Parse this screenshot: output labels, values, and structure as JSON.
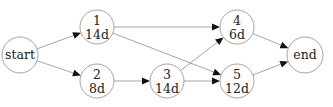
{
  "diagram": {
    "type": "activity-on-node network",
    "nodes": [
      {
        "id": "start",
        "label": "start",
        "duration": null,
        "cx": 20,
        "cy": 55,
        "r": 18
      },
      {
        "id": "1",
        "label": "1",
        "duration": "14d",
        "cx": 97,
        "cy": 27,
        "r": 17
      },
      {
        "id": "2",
        "label": "2",
        "duration": "8d",
        "cx": 97,
        "cy": 81,
        "r": 17
      },
      {
        "id": "3",
        "label": "3",
        "duration": "14d",
        "cx": 167,
        "cy": 81,
        "r": 17
      },
      {
        "id": "4",
        "label": "4",
        "duration": "6d",
        "cx": 237,
        "cy": 27,
        "r": 17
      },
      {
        "id": "5",
        "label": "5",
        "duration": "12d",
        "cx": 237,
        "cy": 81,
        "r": 17
      },
      {
        "id": "end",
        "label": "end",
        "duration": null,
        "cx": 305,
        "cy": 55,
        "r": 18
      }
    ],
    "edges": [
      {
        "from": "start",
        "to": "1"
      },
      {
        "from": "start",
        "to": "2"
      },
      {
        "from": "1",
        "to": "4"
      },
      {
        "from": "1",
        "to": "5"
      },
      {
        "from": "2",
        "to": "3"
      },
      {
        "from": "3",
        "to": "4"
      },
      {
        "from": "3",
        "to": "5"
      },
      {
        "from": "4",
        "to": "end"
      },
      {
        "from": "5",
        "to": "end"
      }
    ]
  }
}
